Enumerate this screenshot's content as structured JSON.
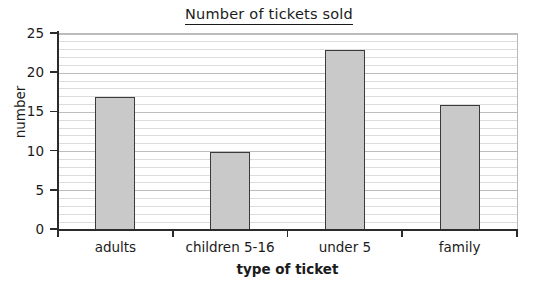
{
  "chart_data": {
    "type": "bar",
    "title": "Number of tickets sold",
    "xlabel": "type of ticket",
    "ylabel": "number",
    "categories": [
      "adults",
      "children 5-16",
      "under 5",
      "family"
    ],
    "values": [
      17,
      10,
      23,
      16
    ],
    "ylim": [
      0,
      25
    ],
    "y_ticks": [
      0,
      5,
      10,
      15,
      20,
      25
    ],
    "y_tick_labels": [
      "0",
      "5",
      "10",
      "15",
      "20",
      "25"
    ],
    "y_major_step": 5,
    "y_minor_step": 1,
    "grid": "horizontal-minor-and-major",
    "legend": "none",
    "bar_fill_color": "#c9c9c9",
    "bar_edge_color": "#3a3a3a",
    "gridline_color": "#dcdcdc",
    "major_gridline_color": "#bdbdbd",
    "axis_color": "#2b2b2b",
    "text_color": "#1b1b1b",
    "background_color": "#ffffff",
    "title_underlined": true
  }
}
